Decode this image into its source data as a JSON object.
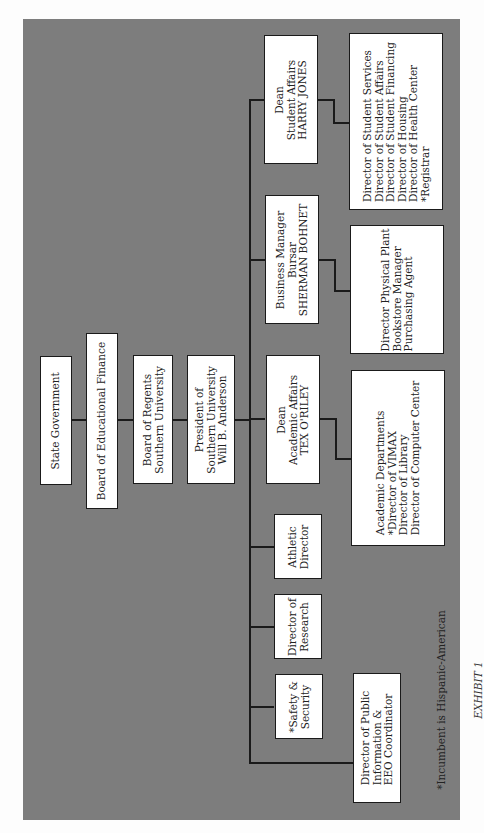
{
  "diagram": {
    "type": "org-chart",
    "orientation": "rotated-90-ccw",
    "background_color": "#7d7d7d",
    "chain": [
      {
        "id": "state",
        "lines": [
          "State Government"
        ]
      },
      {
        "id": "board-ed-finance",
        "lines": [
          "Board of Educational Finance"
        ]
      },
      {
        "id": "board-regents",
        "lines": [
          "Board of Regents",
          "Southern University"
        ]
      },
      {
        "id": "president",
        "lines": [
          "President of",
          "Southern University",
          "Will B. Anderson"
        ]
      }
    ],
    "reports": [
      {
        "id": "dean-student-affairs",
        "lines": [
          "Dean",
          "Student Affairs",
          "HARRY JONES"
        ]
      },
      {
        "id": "business-manager",
        "lines": [
          "Business Manager",
          "Bursar",
          "SHERMAN BOHNET"
        ]
      },
      {
        "id": "dean-academic-affairs",
        "lines": [
          "Dean",
          "Academic Affairs",
          "TEX O'RILEY"
        ]
      },
      {
        "id": "athletic-director",
        "lines": [
          "Athletic",
          "Director"
        ]
      },
      {
        "id": "director-research",
        "lines": [
          "Director of",
          "Research"
        ]
      },
      {
        "id": "safety-security",
        "lines": [
          "*Safety &",
          "Security"
        ]
      },
      {
        "id": "public-info",
        "lines": [
          "Director of Public",
          "Information &",
          "EEO Coordinator"
        ]
      }
    ],
    "sub_units": [
      {
        "id": "student-affairs-units",
        "parent": "dean-student-affairs",
        "lines": [
          "Director of Student Services",
          "Director of Student Affairs",
          "Director of Student Financing",
          "Director of Housing",
          "Director of Health Center",
          "*Registrar"
        ]
      },
      {
        "id": "business-units",
        "parent": "business-manager",
        "lines": [
          "Director Physical Plant",
          "Bookstore Manager",
          "Purchasing Agent"
        ]
      },
      {
        "id": "academic-units",
        "parent": "dean-academic-affairs",
        "lines": [
          "Academic Departments",
          "*Director of VIMAX",
          "Director of Library",
          "Director of Computer Center"
        ]
      }
    ],
    "footnote": "*Incumbent is Hispanic-American",
    "caption": "EXHIBIT 1"
  }
}
